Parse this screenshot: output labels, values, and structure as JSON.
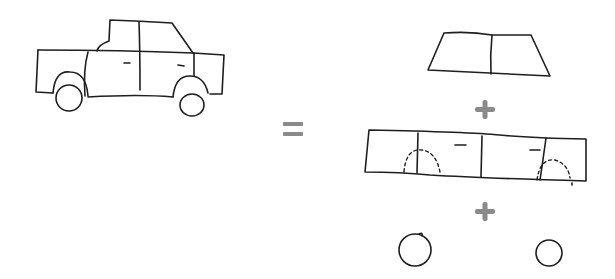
{
  "diagram": {
    "left": {
      "label": "car",
      "parts": [
        "cabin",
        "body",
        "front-wheel",
        "rear-wheel"
      ]
    },
    "operator_equals": "=",
    "right": {
      "parts": [
        {
          "name": "cabin"
        },
        {
          "operator": "+"
        },
        {
          "name": "body",
          "note": "wheel arches drawn dashed"
        },
        {
          "operator": "+"
        },
        {
          "name": "wheels",
          "count": 2
        }
      ]
    },
    "colors": {
      "ink": "#1e1e1e",
      "operator": "#8a8a8a",
      "background": "#ffffff"
    }
  }
}
